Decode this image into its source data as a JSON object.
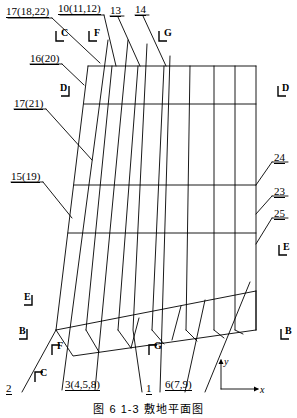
{
  "figure": {
    "caption": "图 6 1-3  敷地平面图",
    "drawing_type": "structural plan / grid layout patent figure"
  },
  "callouts": [
    {
      "id": "c17_18_22",
      "text": "17(18,22)",
      "x": 6,
      "y": 6,
      "underline": true
    },
    {
      "id": "c10_11_12",
      "text": "10(11,12)",
      "x": 58,
      "y": 3,
      "underline": true
    },
    {
      "id": "c13",
      "text": "13",
      "x": 110,
      "y": 5,
      "underline": true
    },
    {
      "id": "c14",
      "text": "14",
      "x": 135,
      "y": 4,
      "underline": true
    },
    {
      "id": "c16_20",
      "text": "16(20)",
      "x": 30,
      "y": 53,
      "underline": true
    },
    {
      "id": "c17_21",
      "text": "17(21)",
      "x": 14,
      "y": 98,
      "underline": true
    },
    {
      "id": "c15_19",
      "text": "15(19)",
      "x": 11,
      "y": 171,
      "underline": true
    },
    {
      "id": "c24",
      "text": "24",
      "x": 274,
      "y": 152,
      "underline": true
    },
    {
      "id": "c23",
      "text": "23",
      "x": 274,
      "y": 186,
      "underline": true
    },
    {
      "id": "c25",
      "text": "25",
      "x": 274,
      "y": 208,
      "underline": true
    },
    {
      "id": "c2",
      "text": "2",
      "x": 6,
      "y": 383,
      "underline": true
    },
    {
      "id": "c3_4_5_8",
      "text": "3(4,5,8)",
      "x": 65,
      "y": 379,
      "underline": true
    },
    {
      "id": "c1",
      "text": "1",
      "x": 146,
      "y": 383,
      "underline": true
    },
    {
      "id": "c6_7_9",
      "text": "6(7,9)",
      "x": 165,
      "y": 379,
      "underline": true
    }
  ],
  "section_markers": [
    {
      "id": "sec_C_top",
      "letter": "C",
      "x": 55,
      "y": 32,
      "orient": "tl"
    },
    {
      "id": "sec_F_top",
      "letter": "F",
      "x": 88,
      "y": 32,
      "orient": "tl"
    },
    {
      "id": "sec_G_top",
      "letter": "G",
      "x": 158,
      "y": 32,
      "orient": "tl"
    },
    {
      "id": "sec_D_left",
      "letter": "D",
      "x": 58,
      "y": 87,
      "orient": "tr"
    },
    {
      "id": "sec_D_right",
      "letter": "D",
      "x": 277,
      "y": 87,
      "orient": "tl"
    },
    {
      "id": "sec_E_right",
      "letter": "E",
      "x": 278,
      "y": 246,
      "orient": "tl"
    },
    {
      "id": "sec_E_left",
      "letter": "E",
      "x": 21,
      "y": 296,
      "orient": "tr"
    },
    {
      "id": "sec_B_left",
      "letter": "B",
      "x": 16,
      "y": 330,
      "orient": "tr"
    },
    {
      "id": "sec_B_right",
      "letter": "B",
      "x": 280,
      "y": 330,
      "orient": "tl"
    },
    {
      "id": "sec_F_bot",
      "letter": "F",
      "x": 51,
      "y": 345,
      "orient": "bl"
    },
    {
      "id": "sec_C_bot",
      "letter": "C",
      "x": 34,
      "y": 372,
      "orient": "bl"
    },
    {
      "id": "sec_G_bot",
      "letter": "G",
      "x": 148,
      "y": 345,
      "orient": "bl"
    }
  ],
  "axes": {
    "origin_x": 221,
    "origin_y": 389,
    "x_label": "x",
    "y_label": "y",
    "x_end": 258,
    "y_top": 360
  },
  "geometry": {
    "description": "Skewed quadrilateral grid: upper dense mesh plus lower slanted strip",
    "outline_top_left": [
      88,
      66
    ],
    "outline_top_right": [
      256,
      66
    ],
    "outline_right_bottom": [
      256,
      330
    ],
    "outline_left_bottom": [
      56,
      330
    ],
    "horizontal_rails_y": [
      66,
      104,
      185,
      233
    ],
    "vertical_count": 8,
    "stroke": "#000000",
    "stroke_width": 0.9
  },
  "colors": {
    "ink": "#000000",
    "paper": "#ffffff"
  }
}
